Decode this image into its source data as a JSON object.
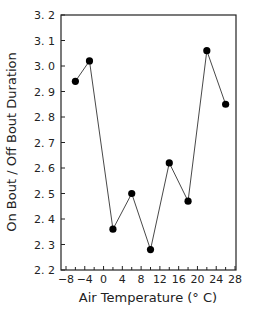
{
  "chart_data": {
    "type": "line",
    "title": "",
    "xlabel": "Air Temperature (° C)",
    "ylabel": "On Bout / Off Bout Duration",
    "xlim": [
      -8,
      28
    ],
    "ylim": [
      2.2,
      3.2
    ],
    "x_ticks": [
      -8,
      -4,
      0,
      4,
      8,
      12,
      16,
      20,
      24,
      28
    ],
    "x_tick_labels": [
      "−8",
      "−4",
      "0",
      "4",
      "8",
      "12",
      "16",
      "20",
      "24",
      "28"
    ],
    "y_ticks": [
      2.2,
      2.3,
      2.4,
      2.5,
      2.6,
      2.7,
      2.8,
      2.9,
      3.0,
      3.1,
      3.2
    ],
    "y_tick_labels": [
      "2. 2",
      "2. 3",
      "2. 4",
      "2. 5",
      "2. 6",
      "2. 7",
      "2. 8",
      "2. 9",
      "3. 0",
      "3. 1",
      "3. 2"
    ],
    "grid": false,
    "legend": null,
    "series": [
      {
        "name": "ratio",
        "marker": "filled-circle",
        "x": [
          -6,
          -3,
          2,
          6,
          10,
          14,
          18,
          22,
          26
        ],
        "values": [
          2.94,
          3.02,
          2.36,
          2.5,
          2.28,
          2.62,
          2.47,
          3.06,
          2.85
        ]
      }
    ]
  }
}
